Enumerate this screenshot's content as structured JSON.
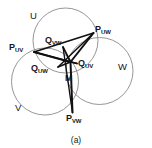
{
  "figure": {
    "caption": "(a)",
    "background_color": "#ffffff",
    "stroke_color": "#8a8a8a",
    "heavy_stroke_color": "#111111",
    "text_color": "#161616"
  },
  "circles": [
    {
      "id": "U",
      "label": "U",
      "cx": 65.5,
      "cy": 40.5,
      "r": 32.5,
      "label_x": 30,
      "label_y": 11
    },
    {
      "id": "V",
      "label": "V",
      "cx": 45.0,
      "cy": 81.5,
      "r": 33.5,
      "label_x": 15,
      "label_y": 103
    },
    {
      "id": "W",
      "label": "W",
      "cx": 99.5,
      "cy": 71.0,
      "r": 33.5,
      "label_x": 118,
      "label_y": 62
    }
  ],
  "points": [
    {
      "id": "P_UV",
      "label": "P",
      "sub": "UV",
      "x": 34.0,
      "y": 52.0,
      "label_x": 9,
      "label_y": 43
    },
    {
      "id": "P_UW",
      "label": "P",
      "sub": "UW",
      "x": 93.5,
      "y": 33.0,
      "label_x": 95,
      "label_y": 25
    },
    {
      "id": "P_VW",
      "label": "P",
      "sub": "VW",
      "x": 72.5,
      "y": 112.5,
      "label_x": 66,
      "label_y": 114
    },
    {
      "id": "Q_VW",
      "label": "Q",
      "sub": "VW",
      "x": 63.0,
      "y": 47.0,
      "label_x": 45,
      "label_y": 36
    },
    {
      "id": "Q_UW",
      "label": "Q",
      "sub": "UW",
      "x": 58.0,
      "y": 67.0,
      "label_x": 31,
      "label_y": 64
    },
    {
      "id": "Q_UV",
      "label": "Q",
      "sub": "UV",
      "x": 77.0,
      "y": 63.5,
      "label_x": 78,
      "label_y": 59
    },
    {
      "id": "M",
      "label": "M",
      "sub": "",
      "x": 70.5,
      "y": 62.0,
      "label_x": 65,
      "label_y": 74
    }
  ],
  "segments": [
    {
      "from": "P_UV",
      "to": "M",
      "weight": "heavy"
    },
    {
      "from": "P_UW",
      "to": "M",
      "weight": "heavy"
    },
    {
      "from": "P_VW",
      "to": "M",
      "weight": "heavy"
    },
    {
      "from": "Q_VW",
      "to": "M",
      "weight": "heavy"
    },
    {
      "from": "Q_UW",
      "to": "M",
      "weight": "heavy"
    },
    {
      "from": "Q_UV",
      "to": "M",
      "weight": "heavy"
    },
    {
      "from": "P_UV",
      "to": "P_UW",
      "weight": "heavy"
    },
    {
      "from": "P_UV",
      "to": "Q_UV",
      "weight": "heavy"
    },
    {
      "from": "P_UW",
      "to": "Q_UW",
      "weight": "heavy"
    },
    {
      "from": "P_VW",
      "to": "Q_VW",
      "weight": "heavy"
    }
  ]
}
